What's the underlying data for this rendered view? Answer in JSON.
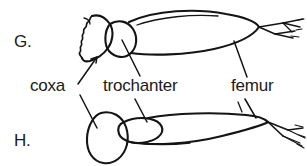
{
  "figure": {
    "background_color": "#ffffff",
    "ink_color": "#141414",
    "text_color": "#1a1a1a",
    "width": 307,
    "height": 166
  },
  "panels": [
    {
      "id": "G",
      "letter": "G.",
      "x": 14,
      "y": 47,
      "description": "upper insect leg with fan-shaped coxa, oval trochanter, elongated femur and tarsal claws"
    },
    {
      "id": "H",
      "letter": "H.",
      "x": 14,
      "y": 146,
      "description": "lower insect leg with rounded coxa, small oval trochanter, slender elongated femur and tarsal claws"
    }
  ],
  "labels": [
    {
      "id": "coxa",
      "text": "coxa",
      "x": 30,
      "y": 91,
      "anchor": "start",
      "leaders": [
        {
          "from": [
            78,
            84
          ],
          "to": [
            97,
            57
          ],
          "arrowhead": true
        },
        {
          "from": [
            80,
            95
          ],
          "to": [
            97,
            128
          ],
          "arrowhead": false
        }
      ]
    },
    {
      "id": "trochanter",
      "text": "trochanter",
      "x": 103,
      "y": 91,
      "anchor": "start",
      "leaders": [
        {
          "from": [
            140,
            76
          ],
          "to": [
            122,
            40
          ],
          "arrowhead": false
        },
        {
          "from": [
            135,
            99
          ],
          "to": [
            147,
            122
          ],
          "arrowhead": false
        }
      ]
    },
    {
      "id": "femur",
      "text": "femur",
      "x": 231,
      "y": 91,
      "anchor": "start",
      "leaders": [
        {
          "from": [
            247,
            77
          ],
          "to": [
            234,
            41
          ],
          "arrowhead": false
        },
        {
          "from": [
            245,
            99
          ],
          "to": [
            256,
            118
          ],
          "arrowhead": false
        }
      ]
    }
  ],
  "anatomy": {
    "segment_names": [
      "coxa",
      "trochanter",
      "femur"
    ],
    "panel_g_parts": [
      "coxa",
      "trochanter",
      "femur",
      "tibia",
      "tarsus"
    ],
    "panel_h_parts": [
      "coxa",
      "trochanter",
      "femur",
      "tibia",
      "tarsus"
    ]
  }
}
